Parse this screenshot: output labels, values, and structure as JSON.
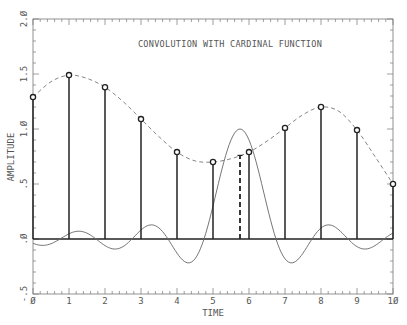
{
  "chart_data": {
    "type": "line",
    "title": "CONVOLUTION WITH CARDINAL FUNCTION",
    "xlabel": "TIME",
    "ylabel": "AMPLITUDE",
    "xlim": [
      0,
      10
    ],
    "ylim": [
      -0.5,
      2.0
    ],
    "x_ticks": [
      "0",
      "1",
      "2",
      "3",
      "4",
      "5",
      "6",
      "7",
      "8",
      "9",
      "10"
    ],
    "y_ticks": [
      "-.5",
      ".0",
      ".5",
      "1.0",
      "1.5",
      "2.0"
    ],
    "grid": false,
    "series": [
      {
        "name": "samples (stems)",
        "style": "stem with open circles",
        "x": [
          0,
          1,
          2,
          3,
          4,
          5,
          6,
          7,
          8,
          9,
          10
        ],
        "values": [
          1.29,
          1.49,
          1.38,
          1.09,
          0.79,
          0.7,
          0.79,
          1.01,
          1.2,
          0.99,
          0.5
        ]
      },
      {
        "name": "interpolated signal",
        "style": "dashed line",
        "x": [
          0,
          0.5,
          1,
          1.5,
          2,
          2.5,
          3,
          3.5,
          4,
          4.5,
          5,
          5.5,
          6,
          6.5,
          7,
          7.5,
          8,
          8.5,
          9,
          9.5,
          10
        ],
        "values": [
          1.29,
          1.43,
          1.49,
          1.46,
          1.38,
          1.25,
          1.09,
          0.93,
          0.79,
          0.71,
          0.7,
          0.73,
          0.79,
          0.89,
          1.01,
          1.13,
          1.2,
          1.16,
          0.99,
          0.75,
          0.5
        ]
      },
      {
        "name": "interpolated point",
        "style": "dashed stem",
        "x": [
          5.75
        ],
        "values": [
          0.76
        ]
      },
      {
        "name": "cardinal (sinc) function",
        "style": "thin solid line",
        "center": 5.75,
        "peak": 1.0
      }
    ]
  }
}
